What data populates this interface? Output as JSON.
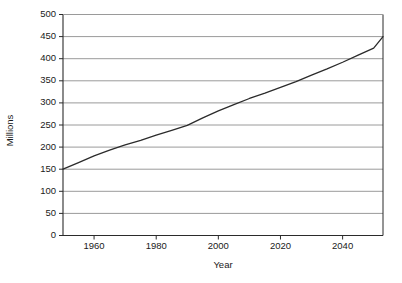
{
  "chart_data": {
    "type": "line",
    "title": "",
    "xlabel": "Year",
    "ylabel": "Millions",
    "xlim": [
      1950,
      2053
    ],
    "ylim": [
      0,
      500
    ],
    "grid": true,
    "legend": false,
    "y_ticks": [
      0,
      50,
      100,
      150,
      200,
      250,
      300,
      350,
      400,
      450,
      500
    ],
    "y_tick_labels": [
      "0",
      "50",
      "100",
      "150",
      "200",
      "250",
      "300",
      "350",
      "400",
      "450",
      "500"
    ],
    "x_ticks": [
      1960,
      1980,
      2000,
      2020,
      2040
    ],
    "x_tick_labels": [
      "1960",
      "1980",
      "2000",
      "2020",
      "2040"
    ],
    "series": [
      {
        "name": "Population",
        "color": "#2b2b2b",
        "x": [
          1950,
          1955,
          1960,
          1965,
          1970,
          1975,
          1980,
          1985,
          1990,
          1995,
          2000,
          2005,
          2010,
          2015,
          2020,
          2025,
          2030,
          2035,
          2040,
          2045,
          2050,
          2053
        ],
        "values": [
          150,
          165,
          180,
          193,
          205,
          215,
          227,
          238,
          249,
          266,
          282,
          296,
          310,
          322,
          335,
          348,
          363,
          377,
          392,
          408,
          424,
          450
        ]
      }
    ]
  },
  "axis_titles": {
    "y": "Millions",
    "x": "Year"
  },
  "colors": {
    "grid": "#9a9a9a",
    "axis": "#2b2b2b",
    "line": "#2b2b2b",
    "background": "#ffffff"
  }
}
